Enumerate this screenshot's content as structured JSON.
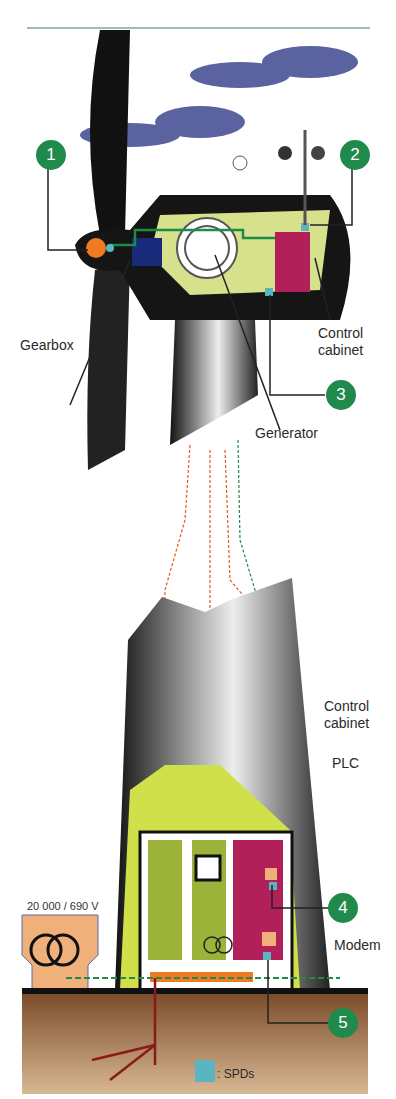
{
  "diagram": {
    "labels": {
      "gearbox": "Gearbox",
      "generator": "Generator",
      "control_cabinet_top": "Control\ncabinet",
      "control_cabinet_bottom": "Control\ncabinet",
      "plc": "PLC",
      "modem": "Modem",
      "transformer": "20 000 / 690 V",
      "legend": ": SPDs"
    },
    "badges": [
      "1",
      "2",
      "3",
      "4",
      "5"
    ],
    "colors": {
      "badge": "#1f8a4c",
      "spd": "#5ab5c0",
      "cabinet_magenta": "#b2205a",
      "nacelle_inner": "#d7e08a",
      "cloud": "#5a63a0",
      "ground": "#8a5a3a",
      "transformer": "#f0b07a"
    }
  }
}
